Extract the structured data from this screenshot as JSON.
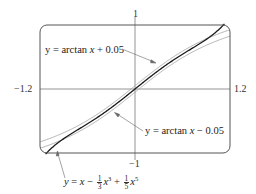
{
  "chart_data": {
    "type": "line",
    "title": "",
    "xlabel": "",
    "ylabel": "",
    "xlim": [
      -1.2,
      1.2
    ],
    "ylim": [
      -1,
      1
    ],
    "grid": false,
    "frame": "rounded-rectangle",
    "tick_labels": {
      "x_left": "−1.2",
      "x_right": "1.2",
      "y_top": "1",
      "y_bottom": "−1"
    },
    "series": [
      {
        "name": "y = arctan x + 0.05",
        "expression": "atan(x)+0.05",
        "color": "#9a9a9a",
        "style": "thin"
      },
      {
        "name": "y = arctan x − 0.05",
        "expression": "atan(x)-0.05",
        "color": "#9a9a9a",
        "style": "thin"
      },
      {
        "name": "y = x − (1/3)x^3 + (1/5)x^5",
        "expression": "x - x^3/3 + x^5/5",
        "color": "#1a1a1a",
        "style": "thick"
      }
    ],
    "annotations": [
      {
        "text": "y = arctan x + 0.05",
        "arrow_to": [
          0.25,
          0.3
        ]
      },
      {
        "text": "y = arctan x − 0.05",
        "arrow_to": [
          0.45,
          0.33
        ]
      },
      {
        "text": "y = x − 1/3 x^3 + 1/5 x^5",
        "arrow_to": [
          -1.05,
          -0.85
        ]
      }
    ]
  },
  "labels": {
    "y_top": "1",
    "y_bottom": "−1",
    "x_left": "−1.2",
    "x_right": "1.2"
  },
  "equations": {
    "upper": {
      "prefix": "y = arctan ",
      "var": "x",
      "suffix": " + 0.05"
    },
    "lower": {
      "prefix": "y = arctan ",
      "var": "x",
      "suffix": " − 0.05"
    },
    "taylor": {
      "y": "y",
      "eq": " = ",
      "x1": "x",
      "minus": " − ",
      "f1_num": "1",
      "f1_den": "3",
      "x3": "x",
      "p3": "3",
      "plus": " + ",
      "f2_num": "1",
      "f2_den": "5",
      "x5": "x",
      "p5": "5"
    }
  },
  "colors": {
    "frame": "#555555",
    "axis": "#777777",
    "taylor": "#1a1a1a",
    "arctan_band": "#a0a0a0"
  }
}
